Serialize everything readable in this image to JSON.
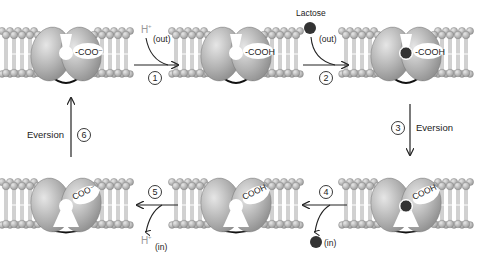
{
  "colors": {
    "protein": "#a9a9a9",
    "protein_light": "#dcdcdc",
    "lipid_head": "#b5b5b5",
    "lactose": "#333333",
    "arrow": "#222222",
    "proton_label": "#999999"
  },
  "states": [
    {
      "id": "s1",
      "row": "top",
      "col": 0,
      "orientation": "outward",
      "group": "-COO⁻",
      "lactose_bound": false
    },
    {
      "id": "s2",
      "row": "top",
      "col": 1,
      "orientation": "outward",
      "group": "-COOH",
      "lactose_bound": false
    },
    {
      "id": "s3",
      "row": "top",
      "col": 2,
      "orientation": "outward",
      "group": "-COOH",
      "lactose_bound": true
    },
    {
      "id": "s4",
      "row": "bottom",
      "col": 2,
      "orientation": "inward",
      "group": "COOH",
      "lactose_bound": true
    },
    {
      "id": "s5",
      "row": "bottom",
      "col": 1,
      "orientation": "inward",
      "group": "COOH",
      "lactose_bound": false
    },
    {
      "id": "s6",
      "row": "bottom",
      "col": 0,
      "orientation": "inward",
      "group": "COO⁻",
      "lactose_bound": false
    }
  ],
  "steps": [
    {
      "number": "1",
      "species": "H⁺",
      "side": "(out)"
    },
    {
      "number": "2",
      "species": "Lactose",
      "side": "(out)"
    },
    {
      "number": "3",
      "label": "Eversion"
    },
    {
      "number": "4",
      "species": "lactose",
      "side": "(in)"
    },
    {
      "number": "5",
      "species": "H⁺",
      "side": "(in)"
    },
    {
      "number": "6",
      "label": "Eversion"
    }
  ]
}
